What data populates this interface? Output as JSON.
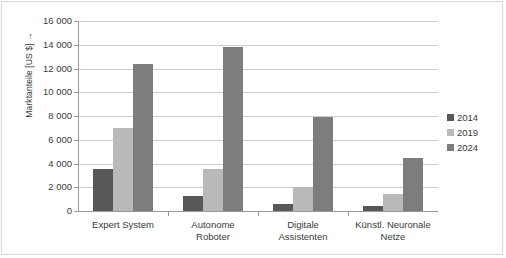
{
  "chart_data": {
    "type": "bar",
    "title": "",
    "subtitle": "",
    "xlabel": "",
    "ylabel": "Marktanteile [US $] →",
    "categories": [
      "Expert System",
      "Autonome Roboter",
      "Digitale Assistenten",
      "Künstl. Neuronale Netze"
    ],
    "category_lines": [
      [
        "Expert System"
      ],
      [
        "Autonome",
        "Roboter"
      ],
      [
        "Digitale",
        "Assistenten"
      ],
      [
        "Künstl. Neuronale",
        "Netze"
      ]
    ],
    "series": [
      {
        "name": "2014",
        "color": "#585858",
        "values": [
          3500,
          1250,
          550,
          400
        ]
      },
      {
        "name": "2019",
        "color": "#b9b9b9",
        "values": [
          7000,
          3500,
          2000,
          1450
        ]
      },
      {
        "name": "2024",
        "color": "#7d7d7d",
        "values": [
          12400,
          13800,
          7950,
          4500
        ]
      }
    ],
    "ylim": [
      0,
      16000
    ],
    "ytick_values": [
      0,
      2000,
      4000,
      6000,
      8000,
      10000,
      12000,
      14000,
      16000
    ],
    "ytick_labels": [
      "0",
      "2 000",
      "4 000",
      "6 000",
      "8 000",
      "10 000",
      "12 000",
      "14 000",
      "16 000"
    ],
    "grid": true,
    "grid_axis": "y",
    "legend_position": "right",
    "legend_entries": [
      {
        "label": "2014",
        "color": "#585858"
      },
      {
        "label": "2019",
        "color": "#b9b9b9"
      },
      {
        "label": "2024",
        "color": "#7d7d7d"
      }
    ],
    "axis_color": "#9a9a9a",
    "gridline_color": "#cfcfcf",
    "background_color": "#ffffff"
  }
}
